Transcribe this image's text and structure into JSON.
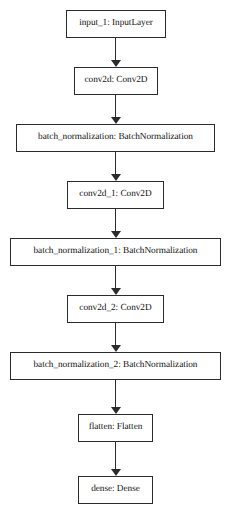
{
  "diagram": {
    "type": "flowchart",
    "orientation": "top-to-bottom",
    "title": "",
    "background_color": "#ffffff",
    "node_border_color": "#2b2b2b",
    "node_fill_color": "#ffffff",
    "edge_color": "#2b2b2b",
    "nodes": [
      {
        "id": "input_1",
        "label": "input_1: InputLayer",
        "layer_name": "input_1",
        "layer_type": "InputLayer",
        "x": 66,
        "y": 10,
        "width": 100,
        "height": 28
      },
      {
        "id": "conv2d",
        "label": "conv2d: Conv2D",
        "layer_name": "conv2d",
        "layer_type": "Conv2D",
        "x": 74,
        "y": 67,
        "width": 84,
        "height": 28
      },
      {
        "id": "batch_normalization",
        "label": "batch_normalization: BatchNormalization",
        "layer_name": "batch_normalization",
        "layer_type": "BatchNormalization",
        "x": 16,
        "y": 124,
        "width": 199,
        "height": 28
      },
      {
        "id": "conv2d_1",
        "label": "conv2d_1: Conv2D",
        "layer_name": "conv2d_1",
        "layer_type": "Conv2D",
        "x": 67,
        "y": 181,
        "width": 97,
        "height": 28
      },
      {
        "id": "batch_normalization_1",
        "label": "batch_normalization_1: BatchNormalization",
        "layer_name": "batch_normalization_1",
        "layer_type": "BatchNormalization",
        "x": 10,
        "y": 238,
        "width": 211,
        "height": 28
      },
      {
        "id": "conv2d_2",
        "label": "conv2d_2: Conv2D",
        "layer_name": "conv2d_2",
        "layer_type": "Conv2D",
        "x": 67,
        "y": 295,
        "width": 97,
        "height": 28
      },
      {
        "id": "batch_normalization_2",
        "label": "batch_normalization_2: BatchNormalization",
        "layer_name": "batch_normalization_2",
        "layer_type": "BatchNormalization",
        "x": 10,
        "y": 352,
        "width": 211,
        "height": 28
      },
      {
        "id": "flatten",
        "label": "flatten: Flatten",
        "layer_name": "flatten",
        "layer_type": "Flatten",
        "x": 78,
        "y": 414,
        "width": 75,
        "height": 28
      },
      {
        "id": "dense",
        "label": "dense: Dense",
        "layer_name": "dense",
        "layer_type": "Dense",
        "x": 78,
        "y": 476,
        "width": 75,
        "height": 28
      }
    ],
    "edges": [
      {
        "id": "e1",
        "from": "input_1",
        "to": "conv2d",
        "x": 110,
        "y": 38,
        "height": 29
      },
      {
        "id": "e2",
        "from": "conv2d",
        "to": "batch_normalization",
        "x": 110,
        "y": 95,
        "height": 29
      },
      {
        "id": "e3",
        "from": "batch_normalization",
        "to": "conv2d_1",
        "x": 110,
        "y": 152,
        "height": 29
      },
      {
        "id": "e4",
        "from": "conv2d_1",
        "to": "batch_normalization_1",
        "x": 110,
        "y": 209,
        "height": 29
      },
      {
        "id": "e5",
        "from": "batch_normalization_1",
        "to": "conv2d_2",
        "x": 110,
        "y": 266,
        "height": 29
      },
      {
        "id": "e6",
        "from": "conv2d_2",
        "to": "batch_normalization_2",
        "x": 110,
        "y": 323,
        "height": 29
      },
      {
        "id": "e7",
        "from": "batch_normalization_2",
        "to": "flatten",
        "x": 110,
        "y": 380,
        "height": 34
      },
      {
        "id": "e8",
        "from": "flatten",
        "to": "dense",
        "x": 110,
        "y": 442,
        "height": 34
      }
    ]
  }
}
